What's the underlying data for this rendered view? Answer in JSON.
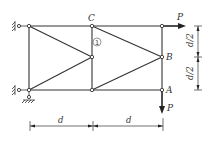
{
  "diagram": {
    "type": "plane truss",
    "nodes": [
      {
        "id": "TL",
        "x": 29,
        "y": 26,
        "label": ""
      },
      {
        "id": "BL",
        "x": 29,
        "y": 90,
        "label": ""
      },
      {
        "id": "C",
        "x": 92,
        "y": 26,
        "label": "C"
      },
      {
        "id": "M",
        "x": 92,
        "y": 57,
        "label": ""
      },
      {
        "id": "BM",
        "x": 92,
        "y": 90,
        "label": ""
      },
      {
        "id": "TR",
        "x": 162,
        "y": 26,
        "label": ""
      },
      {
        "id": "B",
        "x": 162,
        "y": 57,
        "label": "B"
      },
      {
        "id": "A",
        "x": 162,
        "y": 90,
        "label": "A"
      }
    ],
    "members": [
      [
        "TL",
        "C"
      ],
      [
        "C",
        "TR"
      ],
      [
        "BL",
        "BM"
      ],
      [
        "BM",
        "A"
      ],
      [
        "TL",
        "BL"
      ],
      [
        "C",
        "M"
      ],
      [
        "M",
        "BM"
      ],
      [
        "TR",
        "B"
      ],
      [
        "B",
        "A"
      ],
      [
        "TL",
        "M"
      ],
      [
        "BL",
        "M"
      ],
      [
        "C",
        "B"
      ],
      [
        "BM",
        "B"
      ]
    ],
    "member_label": {
      "text": "1",
      "style": "circled",
      "member": "C-M"
    },
    "node_labels": {
      "C": "C",
      "B": "B",
      "A": "A"
    },
    "loads": [
      {
        "node": "TR",
        "direction": "right",
        "label": "P"
      },
      {
        "node": "A",
        "direction": "down",
        "label": "P"
      }
    ],
    "supports": [
      {
        "node": "TL",
        "type": "horizontal link (wall)"
      },
      {
        "node": "BL",
        "type": "pin with wall link"
      }
    ],
    "dimensions": {
      "horizontal": [
        {
          "label": "d"
        },
        {
          "label": "d"
        }
      ],
      "vertical": [
        {
          "label": "d/2"
        },
        {
          "label": "d/2"
        }
      ]
    }
  }
}
